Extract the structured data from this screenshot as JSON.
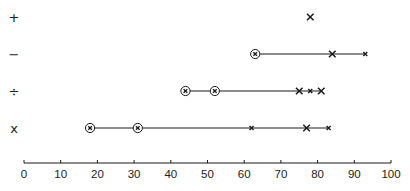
{
  "chart_data": {
    "type": "scatter",
    "title": "",
    "xlabel": "",
    "ylabel": "",
    "xlim": [
      0,
      100
    ],
    "x_ticks": [
      0,
      10,
      20,
      30,
      40,
      50,
      60,
      70,
      80,
      90,
      100
    ],
    "grid": false,
    "legend": null,
    "rows": [
      {
        "label": "+",
        "name": "addition",
        "points": [
          {
            "x": 78,
            "marker": "large-x"
          }
        ],
        "line": null
      },
      {
        "label": "−",
        "name": "subtraction",
        "points": [
          {
            "x": 63,
            "marker": "circled"
          },
          {
            "x": 84,
            "marker": "large-x"
          },
          {
            "x": 93,
            "marker": "small-x"
          }
        ],
        "line": [
          63,
          93
        ]
      },
      {
        "label": "÷",
        "name": "division",
        "points": [
          {
            "x": 44,
            "marker": "circled"
          },
          {
            "x": 52,
            "marker": "circled"
          },
          {
            "x": 75,
            "marker": "large-x"
          },
          {
            "x": 78,
            "marker": "small-x"
          },
          {
            "x": 81,
            "marker": "large-x"
          }
        ],
        "line": [
          44,
          81
        ]
      },
      {
        "label": "x",
        "name": "multiplication",
        "points": [
          {
            "x": 18,
            "marker": "circled"
          },
          {
            "x": 31,
            "marker": "circled"
          },
          {
            "x": 62,
            "marker": "small-x"
          },
          {
            "x": 77,
            "marker": "large-x"
          },
          {
            "x": 83,
            "marker": "small-x"
          }
        ],
        "line": [
          18,
          83
        ]
      }
    ]
  },
  "colors": {
    "ink": "#1a1a1a",
    "background": "#ffffff"
  }
}
